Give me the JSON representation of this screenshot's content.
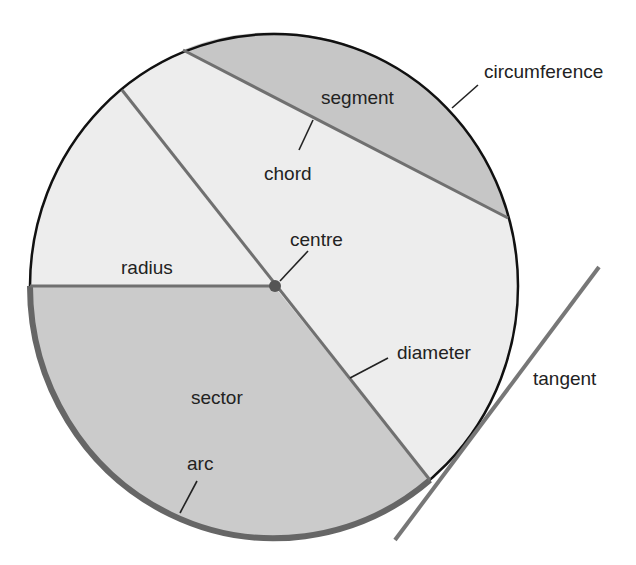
{
  "diagram": {
    "colors": {
      "segment_fill": "#c6c6c6",
      "sector_fill": "#cbcbcb",
      "interior_fill": "#ededed",
      "circumference_stroke": "#111111",
      "line_stroke": "#707070",
      "arc_stroke": "#666666",
      "centre_dot": "#555555"
    },
    "labels": {
      "circumference": "circumference",
      "segment": "segment",
      "chord": "chord",
      "centre": "centre",
      "radius": "radius",
      "diameter": "diameter",
      "tangent": "tangent",
      "sector": "sector",
      "arc": "arc"
    }
  }
}
